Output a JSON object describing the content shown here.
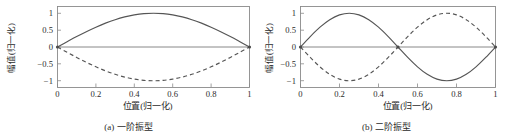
{
  "figure": {
    "background": "#ffffff",
    "line_color": "#555555",
    "frame_color": "#8a8a8a",
    "text_color": "#2b2b2b"
  },
  "panels": [
    {
      "id": "panel-a",
      "caption_tag": "(a)",
      "caption_text": "一阶振型",
      "xlabel": "位置(归一化)",
      "ylabel": "幅值(归一化)",
      "xticks": [
        "0",
        "0.2",
        "0.4",
        "0.6",
        "0.8",
        "1"
      ],
      "yticks": [
        "1",
        "0.5",
        "0",
        "−0.5",
        "−1"
      ]
    },
    {
      "id": "panel-b",
      "caption_tag": "(b)",
      "caption_text": "二阶振型",
      "xlabel": "位置(归一化)",
      "ylabel": "幅值(归一化)",
      "xticks": [
        "0",
        "0.2",
        "0.4",
        "0.6",
        "0.8",
        "1"
      ],
      "yticks": [
        "1",
        "0.5",
        "0",
        "−0.5",
        "−1"
      ]
    }
  ],
  "chart_data": [
    {
      "type": "line",
      "panel": "(a) 一阶振型",
      "title": "",
      "xlabel": "位置(归一化)",
      "ylabel": "幅值(归一化)",
      "xlim": [
        0,
        1
      ],
      "ylim": [
        -1.2,
        1.2
      ],
      "xticks": [
        0,
        0.2,
        0.4,
        0.6,
        0.8,
        1
      ],
      "yticks": [
        1,
        0.5,
        0,
        -0.5,
        -1
      ],
      "grid": false,
      "legend": "none",
      "series": [
        {
          "name": "一阶振型 (正相位)",
          "style": "solid",
          "formula": "sin(pi*x)",
          "x": [
            0,
            0.05,
            0.1,
            0.15,
            0.2,
            0.25,
            0.3,
            0.35,
            0.4,
            0.45,
            0.5,
            0.55,
            0.6,
            0.65,
            0.7,
            0.75,
            0.8,
            0.85,
            0.9,
            0.95,
            1
          ],
          "values": [
            0,
            0.156,
            0.309,
            0.454,
            0.588,
            0.707,
            0.809,
            0.891,
            0.951,
            0.988,
            1,
            0.988,
            0.951,
            0.891,
            0.809,
            0.707,
            0.588,
            0.454,
            0.309,
            0.156,
            0
          ]
        },
        {
          "name": "一阶振型 (反相位)",
          "style": "dashed",
          "formula": "-sin(pi*x)",
          "x": [
            0,
            0.05,
            0.1,
            0.15,
            0.2,
            0.25,
            0.3,
            0.35,
            0.4,
            0.45,
            0.5,
            0.55,
            0.6,
            0.65,
            0.7,
            0.75,
            0.8,
            0.85,
            0.9,
            0.95,
            1
          ],
          "values": [
            0,
            -0.156,
            -0.309,
            -0.454,
            -0.588,
            -0.707,
            -0.809,
            -0.891,
            -0.951,
            -0.988,
            -1,
            -0.988,
            -0.951,
            -0.891,
            -0.809,
            -0.707,
            -0.588,
            -0.454,
            -0.309,
            -0.156,
            0
          ]
        }
      ]
    },
    {
      "type": "line",
      "panel": "(b) 二阶振型",
      "title": "",
      "xlabel": "位置(归一化)",
      "ylabel": "幅值(归一化)",
      "xlim": [
        0,
        1
      ],
      "ylim": [
        -1.2,
        1.2
      ],
      "xticks": [
        0,
        0.2,
        0.4,
        0.6,
        0.8,
        1
      ],
      "yticks": [
        1,
        0.5,
        0,
        -0.5,
        -1
      ],
      "grid": false,
      "legend": "none",
      "series": [
        {
          "name": "二阶振型 (正相位)",
          "style": "solid",
          "formula": "sin(2*pi*x)",
          "x": [
            0,
            0.05,
            0.1,
            0.15,
            0.2,
            0.25,
            0.3,
            0.35,
            0.4,
            0.45,
            0.5,
            0.55,
            0.6,
            0.65,
            0.7,
            0.75,
            0.8,
            0.85,
            0.9,
            0.95,
            1
          ],
          "values": [
            0,
            0.309,
            0.588,
            0.809,
            0.951,
            1,
            0.951,
            0.809,
            0.588,
            0.309,
            0,
            -0.309,
            -0.588,
            -0.809,
            -0.951,
            -1,
            -0.951,
            -0.809,
            -0.588,
            -0.309,
            0
          ]
        },
        {
          "name": "二阶振型 (反相位)",
          "style": "dashed",
          "formula": "-sin(2*pi*x)",
          "x": [
            0,
            0.05,
            0.1,
            0.15,
            0.2,
            0.25,
            0.3,
            0.35,
            0.4,
            0.45,
            0.5,
            0.55,
            0.6,
            0.65,
            0.7,
            0.75,
            0.8,
            0.85,
            0.9,
            0.95,
            1
          ],
          "values": [
            0,
            -0.309,
            -0.588,
            -0.809,
            -0.951,
            -1,
            -0.951,
            -0.809,
            -0.588,
            -0.309,
            0,
            0.309,
            0.588,
            0.809,
            0.951,
            1,
            0.951,
            0.809,
            0.588,
            0.309,
            0
          ]
        }
      ]
    }
  ]
}
